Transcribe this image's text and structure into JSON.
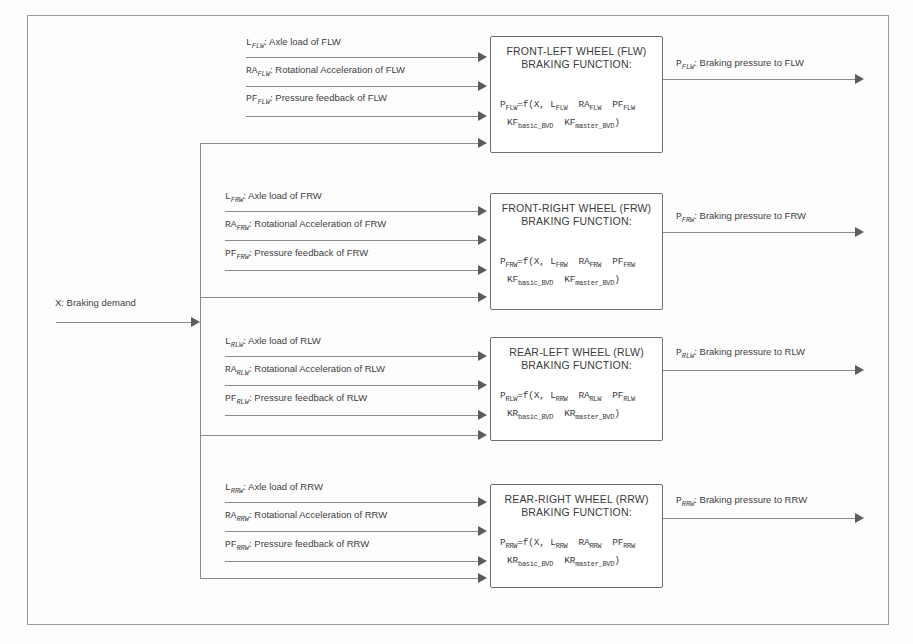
{
  "diagram": {
    "global_input": {
      "symbol": "X",
      "label": "X: Braking demand"
    },
    "blocks": [
      {
        "id": "flw",
        "title_line1": "FRONT-LEFT WHEEL (FLW)",
        "title_line2": "BRAKING FUNCTION:",
        "formula_line1_head": "P",
        "formula_line1_head_sub": "FLW",
        "formula_line1_rest": "=f(X, L",
        "formula_terms": [
          "FLW",
          "FLW",
          "FLW"
        ],
        "formula_line1_mid": "  RA",
        "formula_line1_mid2": "  PF",
        "formula_line2_k1": "KF",
        "formula_line2_k1_sub": "basic_BVD",
        "formula_line2_k2": "KF",
        "formula_line2_k2_sub": "master_BVD",
        "formula_line2_tail": ")",
        "inputs": [
          {
            "symbol": "L",
            "sub": "FLW",
            "text": ": Axle load of FLW"
          },
          {
            "symbol": "RA",
            "sub": "FLW",
            "text": ": Rotational Acceleration of FLW"
          },
          {
            "symbol": "PF",
            "sub": "FLW",
            "text": ": Pressure feedback of FLW"
          }
        ],
        "output": {
          "symbol": "P",
          "sub": "FLW",
          "text": ": Braking pressure to FLW"
        }
      },
      {
        "id": "frw",
        "title_line1": "FRONT-RIGHT WHEEL (FRW)",
        "title_line2": "BRAKING FUNCTION:",
        "formula_line1_head": "P",
        "formula_line1_head_sub": "FRW",
        "formula_line1_rest": "=f(X, L",
        "formula_terms": [
          "FRW",
          "FRW",
          "FRW"
        ],
        "formula_line1_mid": "  RA",
        "formula_line1_mid2": "  PF",
        "formula_line2_k1": "KF",
        "formula_line2_k1_sub": "basic_BVD",
        "formula_line2_k2": "KF",
        "formula_line2_k2_sub": "master_BVD",
        "formula_line2_tail": ")",
        "inputs": [
          {
            "symbol": "L",
            "sub": "FRW",
            "text": ": Axle load of FRW"
          },
          {
            "symbol": "RA",
            "sub": "FRW",
            "text": ": Rotational Acceleration of FRW"
          },
          {
            "symbol": "PF",
            "sub": "FRW",
            "text": ": Pressure feedback of FRW"
          }
        ],
        "output": {
          "symbol": "P",
          "sub": "FRW",
          "text": ": Braking pressure to FRW"
        }
      },
      {
        "id": "rlw",
        "title_line1": "REAR-LEFT WHEEL (RLW)",
        "title_line2": "BRAKING FUNCTION:",
        "formula_line1_head": "P",
        "formula_line1_head_sub": "RLW",
        "formula_line1_rest": "=f(X, L",
        "formula_terms": [
          "RRW",
          "RLW",
          "RLW"
        ],
        "formula_line1_mid": "  RA",
        "formula_line1_mid2": "  PF",
        "formula_line2_k1": "KR",
        "formula_line2_k1_sub": "basic_BVD",
        "formula_line2_k2": "KR",
        "formula_line2_k2_sub": "master_BVD",
        "formula_line2_tail": ")",
        "inputs": [
          {
            "symbol": "L",
            "sub": "RLW",
            "text": ": Axle load of RLW"
          },
          {
            "symbol": "RA",
            "sub": "RLW",
            "text": ": Rotational Acceleration of RLW"
          },
          {
            "symbol": "PF",
            "sub": "RLW",
            "text": ": Pressure feedback of RLW"
          }
        ],
        "output": {
          "symbol": "P",
          "sub": "RLW",
          "text": ": Braking pressure to RLW"
        }
      },
      {
        "id": "rrw",
        "title_line1": "REAR-RIGHT WHEEL  (RRW)",
        "title_line2": "BRAKING FUNCTION:",
        "formula_line1_head": "P",
        "formula_line1_head_sub": "RRW",
        "formula_line1_rest": "=f(X, L",
        "formula_terms": [
          "RRW",
          "RRW",
          "RRW"
        ],
        "formula_line1_mid": "  RA",
        "formula_line1_mid2": "  PF",
        "formula_line2_k1": "KR",
        "formula_line2_k1_sub": "basic_BVD",
        "formula_line2_k2": "KR",
        "formula_line2_k2_sub": "master_BVD",
        "formula_line2_tail": ")",
        "inputs": [
          {
            "symbol": "L",
            "sub": "RRW",
            "text": ": Axle load of RRW"
          },
          {
            "symbol": "RA",
            "sub": "RRW",
            "text": ": Rotational Acceleration of RRW"
          },
          {
            "symbol": "PF",
            "sub": "RRW",
            "text": ": Pressure feedback of RRW"
          }
        ],
        "output": {
          "symbol": "P",
          "sub": "RRW",
          "text": ": Braking pressure to RRW"
        }
      }
    ]
  }
}
